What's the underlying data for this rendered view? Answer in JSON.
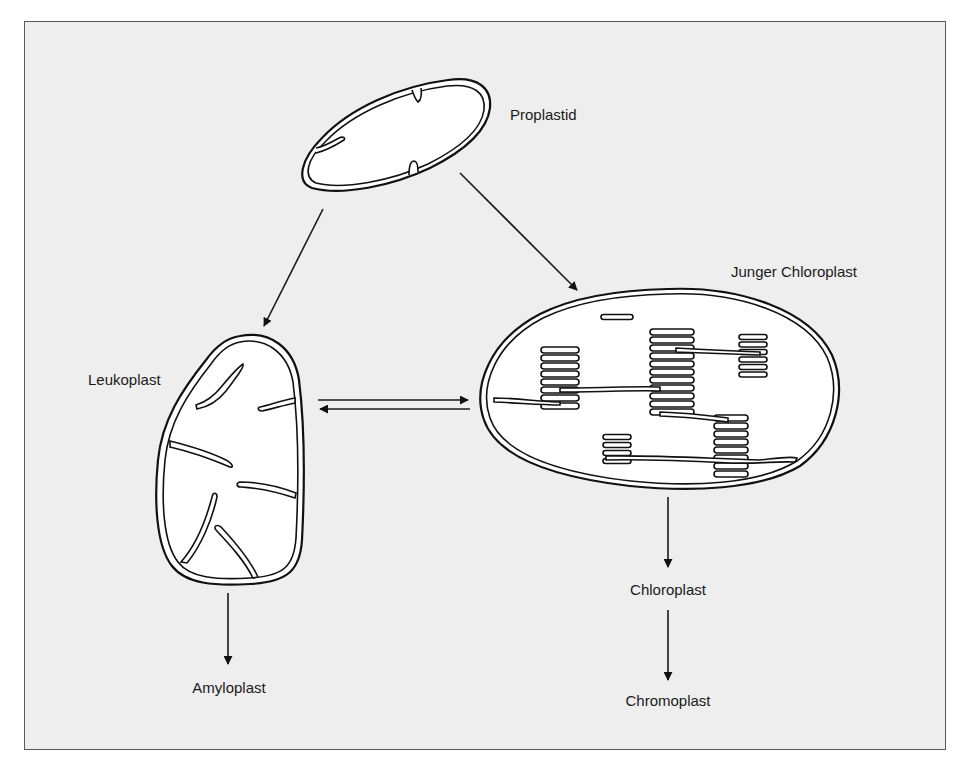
{
  "diagram": {
    "type": "plastid-development-flow",
    "labels": {
      "proplastid": "Proplastid",
      "young_chloroplast": "Junger Chloroplast",
      "leukoplast": "Leukoplast",
      "amyloplast": "Amyloplast",
      "chloroplast": "Chloroplast",
      "chromoplast": "Chromoplast"
    },
    "edges": [
      {
        "from": "Proplastid",
        "to": "Leukoplast",
        "direction": "one-way"
      },
      {
        "from": "Proplastid",
        "to": "Junger Chloroplast",
        "direction": "one-way"
      },
      {
        "from": "Leukoplast",
        "to": "Junger Chloroplast",
        "direction": "bidirectional"
      },
      {
        "from": "Leukoplast",
        "to": "Amyloplast",
        "direction": "one-way"
      },
      {
        "from": "Junger Chloroplast",
        "to": "Chloroplast",
        "direction": "one-way"
      },
      {
        "from": "Chloroplast",
        "to": "Chromoplast",
        "direction": "one-way"
      }
    ],
    "colors": {
      "background": "#eeeeee",
      "line": "#111111",
      "organelle_fill": "#ffffff"
    }
  }
}
